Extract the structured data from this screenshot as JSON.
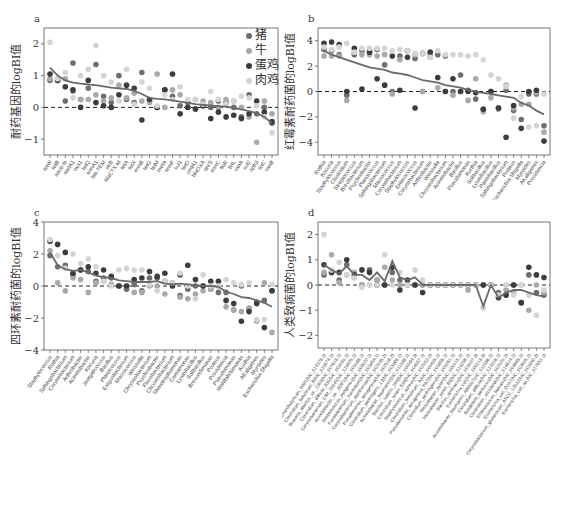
{
  "legend": {
    "items": [
      {
        "label": "猪",
        "color": "#6e6e6e"
      },
      {
        "label": "牛",
        "color": "#a9a9a9"
      },
      {
        "label": "蛋鸡",
        "color": "#3c3c3c"
      },
      {
        "label": "肉鸡",
        "color": "#d4d4d4"
      }
    ]
  },
  "colors": {
    "line": "#6a6a6a",
    "axis": "#555555",
    "zero": "#222222"
  },
  "chart_data": [
    {
      "id": "a",
      "type": "scatter",
      "panel_label": "a",
      "title": "",
      "xlabel": "",
      "ylabel": "耐药基因的logBI值",
      "ylim": [
        -1.5,
        2.5
      ],
      "yticks": [
        -1,
        0,
        1,
        2
      ],
      "legend_position": "top-right",
      "categories": [
        "tetW",
        "tetB",
        "aac6-Ib",
        "aadA1",
        "oxa1",
        "tetQ",
        "ermA1",
        "bla-TEM",
        "strB",
        "blaCTX-M",
        "tetA",
        "tetX",
        "ermB",
        "tetG",
        "tetM",
        "mefA",
        "ermF",
        "sul1",
        "tetO",
        "cmlA1",
        "blaOXA",
        "qnrS",
        "ermC",
        "floR",
        "tetL",
        "vanA",
        "sul2",
        "aph3",
        "tetC",
        "vanB"
      ],
      "series": [
        {
          "name": "猪",
          "values": [
            0.85,
            0.85,
            0.2,
            1.4,
            0.25,
            0.6,
            1.35,
            0.35,
            0.15,
            1.0,
            0.25,
            0.15,
            1.1,
            0.2,
            0.0,
            0.55,
            0.35,
            0.05,
            0.15,
            -0.05,
            0.05,
            0.0,
            0.2,
            0.15,
            0.0,
            -0.3,
            0.4,
            -0.2,
            0.0,
            -0.5
          ]
        },
        {
          "name": "牛",
          "values": [
            0.9,
            0.9,
            0.9,
            0.5,
            0.25,
            0.25,
            0.4,
            0.2,
            0.3,
            0.7,
            0.3,
            0.45,
            0.2,
            0.15,
            1.05,
            0.0,
            0.55,
            0.4,
            0.0,
            0.25,
            0.2,
            0.15,
            0.0,
            0.25,
            0.2,
            0.0,
            -0.3,
            -1.1,
            0.2,
            -0.2
          ]
        },
        {
          "name": "蛋鸡",
          "values": [
            1.05,
            0.85,
            0.65,
            0.55,
            0.0,
            0.85,
            0.15,
            0.05,
            0.0,
            0.4,
            0.7,
            0.6,
            -0.4,
            0.25,
            0.0,
            0.55,
            1.05,
            -0.2,
            0.0,
            -0.05,
            0.05,
            -0.35,
            -0.15,
            -0.3,
            -0.25,
            -0.35,
            -0.2,
            0.2,
            -0.15,
            -0.45
          ]
        },
        {
          "name": "肉鸡",
          "values": [
            2.05,
            0.9,
            1.1,
            0.3,
            1.0,
            1.2,
            1.95,
            1.0,
            0.8,
            0.2,
            1.2,
            0.1,
            0.8,
            0.6,
            0.05,
            0.4,
            0.25,
            0.65,
            0.25,
            0.25,
            0.1,
            0.5,
            0.25,
            0.1,
            0.2,
            0.35,
            0.3,
            0.05,
            -0.3,
            -0.8
          ]
        },
        {
          "name": "trend",
          "values": [
            1.25,
            1.0,
            0.85,
            0.78,
            0.75,
            0.72,
            0.7,
            0.66,
            0.62,
            0.6,
            0.58,
            0.52,
            0.42,
            0.3,
            0.27,
            0.25,
            0.22,
            0.18,
            0.14,
            0.1,
            0.08,
            0.06,
            0.04,
            0.02,
            -0.02,
            -0.06,
            -0.12,
            -0.18,
            -0.3,
            -0.5
          ]
        }
      ]
    },
    {
      "id": "b",
      "type": "scatter",
      "panel_label": "b",
      "xlabel": "",
      "ylabel": "红霉素耐药菌的logBI值",
      "ylim": [
        -5,
        5
      ],
      "yticks": [
        -4,
        -2,
        0,
        2,
        4
      ],
      "categories": [
        "Rothia",
        "Kocuria",
        "Staphylococcus",
        "Clostridium",
        "Streptococcus",
        "Brevibacterium",
        "Psychrobacter",
        "Planococcus",
        "Sphingobacterium",
        "Macrococcus",
        "Corynebacterium",
        "Staphylococcus",
        "Enterococcus",
        "Corynebacterium",
        "Arthrobacter",
        "Weissella",
        "Chryseobacterium",
        "Acinetobacter",
        "Bacillus",
        "Pseudomonas",
        "Kurthia",
        "Solibacillus",
        "Lysinibacillus",
        "Paenibacillus",
        "Sphingobacterium",
        "Proteus",
        "Escherichia-Shigella",
        "Myroides",
        "Alcaligenes",
        "Providencia"
      ],
      "series": [
        {
          "name": "猪",
          "values": [
            3.3,
            3.2,
            2.9,
            -0.3,
            2.9,
            3.2,
            3.2,
            3.3,
            2.1,
            0.0,
            2.8,
            3.2,
            2.6,
            0.0,
            2.7,
            2.9,
            2.8,
            0.0,
            1.3,
            0.1,
            -0.6,
            -1.4,
            0.0,
            -1.3,
            0.1,
            -1.5,
            -2.2,
            -0.2,
            -0.2,
            -2.7
          ]
        },
        {
          "name": "牛",
          "values": [
            2.8,
            2.8,
            2.8,
            -0.7,
            3.1,
            2.9,
            2.9,
            2.8,
            2.9,
            -0.2,
            2.5,
            3.2,
            2.9,
            0.0,
            2.9,
            0.3,
            0.0,
            -0.3,
            0.0,
            -0.7,
            1.0,
            -1.6,
            -0.5,
            -1.4,
            0.5,
            -1.3,
            -1.0,
            -1.0,
            -0.1,
            -3.2
          ]
        },
        {
          "name": "蛋鸡",
          "values": [
            3.8,
            3.9,
            3.7,
            0.0,
            3.4,
            0.2,
            3.1,
            1.0,
            0.5,
            2.8,
            0.1,
            2.7,
            -1.3,
            3.0,
            3.1,
            1.1,
            0.0,
            1.0,
            0.0,
            0.0,
            -0.1,
            -1.4,
            0.0,
            -1.3,
            -3.6,
            -1.1,
            -2.9,
            0.0,
            0.1,
            -3.9
          ]
        },
        {
          "name": "肉鸡",
          "values": [
            3.5,
            3.3,
            3.5,
            3.8,
            3.1,
            3.4,
            3.4,
            3.4,
            3.4,
            3.2,
            3.3,
            3.2,
            3.0,
            3.0,
            2.7,
            3.2,
            2.9,
            2.9,
            2.9,
            2.8,
            2.9,
            2.5,
            1.3,
            1.0,
            0.4,
            -2.1,
            -0.4,
            -2.8,
            -2.7,
            -0.2
          ]
        },
        {
          "name": "trend",
          "values": [
            3.2,
            2.9,
            2.7,
            2.5,
            2.3,
            2.1,
            1.9,
            1.8,
            1.7,
            1.5,
            1.4,
            1.3,
            1.1,
            0.9,
            0.8,
            0.7,
            0.5,
            0.4,
            0.3,
            0.1,
            0.0,
            -0.1,
            -0.2,
            -0.3,
            -0.4,
            -0.5,
            -0.9,
            -1.1,
            -1.5,
            -1.8
          ]
        }
      ]
    },
    {
      "id": "c",
      "type": "scatter",
      "panel_label": "c",
      "xlabel": "",
      "ylabel": "四环素耐药菌的logBI值",
      "ylim": [
        -4,
        4
      ],
      "yticks": [
        -4,
        -2,
        0,
        2,
        4
      ],
      "categories": [
        "Staphylococcus",
        "Rothia",
        "Sphingobacterium",
        "Corynebacterium",
        "Arthrobacter",
        "Acinetobacter",
        "Kocuria",
        "Jeotgalicoccus",
        "Bacillus",
        "Planococcus",
        "Exiguobacterium",
        "Macrococcus",
        "Weissella",
        "Chryseobacterium",
        "Psychrobacter",
        "Flavobacterium",
        "Chryseobacterium",
        "Stenotrophomonas",
        "Comamonas",
        "Lysinibacillus",
        "Solibacillus",
        "Brevundimonas",
        "Proteus",
        "Providencia",
        "Pseudomonas",
        "Wohlfahrtiimonas",
        "Kurthia",
        "Alcaligenes",
        "Myroides",
        "Escherichia-Shigella"
      ],
      "series": [
        {
          "name": "猪",
          "values": [
            1.9,
            1.2,
            1.3,
            0.7,
            1.0,
            0.9,
            0.3,
            0.5,
            0.5,
            0.0,
            -0.2,
            0.1,
            -0.3,
            0.5,
            0.5,
            0.3,
            0.2,
            -0.6,
            -0.2,
            0.0,
            0.0,
            -0.2,
            -0.4,
            -0.4,
            -1.5,
            0.0,
            -1.4,
            -1.0,
            -0.9,
            -0.3
          ]
        },
        {
          "name": "牛",
          "values": [
            2.2,
            0.2,
            -0.3,
            0.5,
            0.4,
            -0.4,
            0.2,
            0.3,
            0.1,
            0.0,
            0.0,
            -0.4,
            -0.4,
            0.0,
            0.0,
            -0.5,
            0.0,
            -0.7,
            -0.8,
            -0.5,
            -0.3,
            -0.2,
            0.0,
            -1.3,
            -1.5,
            -1.6,
            -1.4,
            -2.2,
            0.2,
            -2.9
          ]
        },
        {
          "name": "蛋鸡",
          "values": [
            2.8,
            2.6,
            2.1,
            0.8,
            1.0,
            1.2,
            0.8,
            1.0,
            0.6,
            0.0,
            0.0,
            0.4,
            0.5,
            0.9,
            0.6,
            0.8,
            0.0,
            0.7,
            1.3,
            0.4,
            0.0,
            0.3,
            0.3,
            -0.9,
            -1.1,
            -2.2,
            -1.6,
            -1.1,
            -2.6,
            -0.3
          ]
        },
        {
          "name": "肉鸡",
          "values": [
            2.9,
            1.9,
            1.1,
            2.0,
            1.4,
            1.7,
            1.2,
            0.3,
            0.0,
            1.0,
            1.1,
            1.0,
            1.0,
            0.1,
            -0.3,
            0.3,
            0.2,
            0.8,
            0.0,
            -0.8,
            0.7,
            0.0,
            0.0,
            0.4,
            0.2,
            0.1,
            0.2,
            -2.1,
            -2.1,
            0.1
          ]
        },
        {
          "name": "trend",
          "values": [
            2.1,
            1.3,
            1.05,
            0.95,
            1.0,
            0.85,
            0.65,
            0.55,
            0.5,
            0.35,
            0.3,
            0.25,
            0.25,
            0.25,
            0.3,
            0.15,
            0.1,
            0.15,
            0.1,
            0.05,
            0.0,
            0.0,
            -0.05,
            -0.35,
            -0.5,
            -0.7,
            -0.75,
            -0.9,
            -1.05,
            -1.3
          ]
        }
      ]
    },
    {
      "id": "d",
      "type": "scatter",
      "panel_label": "d",
      "xlabel": "",
      "ylabel": "人类致病菌的logBI值",
      "ylim": [
        -2.5,
        2.5
      ],
      "yticks": [
        -2,
        -1,
        0,
        1,
        2
      ],
      "categories": [
        "Clostridium_saccharobutylicum_WM1(NC_014378.1)",
        "Clostridium_botulinum_B(NC_010674.1)",
        "Brucella_abortus_str._2308(NC_007618.1)",
        "Clostridium_difficile_630(NC_009089.1)",
        "Corynebacterium_CIM_20045(NC_018425.1)",
        "Acinetobacter_sp._ADP1(NC_005966.1)",
        "Streptococcus_pyogenes(NC_008022.1)",
        "Fusobacterium_nucleatum(NC_003454.1)",
        "Corynebacterium_diphtheriae(NC_002935.2)",
        "Pseudomonas_aeruginosa(NC_002516.2)",
        "Clostridium_perfringens_13(NC_003366.1)",
        "Acinetobacter_baumannii(NC_011586.1)",
        "Bacillus_subtilis_168(NC_000964.3)",
        "Clostridium_tetani_E88(NC_004557.1)",
        "Staphylococcus_aureus(NC_002952.2)",
        "Clostridium_botulinum_A(NC_009495.1)",
        "Pseudomonas_aeruginosa_PA7(NC_009656.1)",
        "Clostridium_perfringens(NC_008261.1)",
        "Helicobacter_pylori(NC_000915.1)",
        "Helicobacter_pylori_B8(NC_014256.1)",
        "Bacillus_anthracis(NC_003997.3)",
        "Escherichia_coli(NC_000913.3)",
        "Acinetobacter_baumannii_AB0057(NC_011586.1)",
        "Clostridium_difficile(NC_013316.1)",
        "Bordetella_pertussis(NC_002929.2)",
        "Clostridium_sticklandii(NC_014614.1)",
        "Enterococcus_faecalis(NC_004668.1)",
        "Escherichia_coli_O157(NC_002695.1)",
        "Corynebacterium_glutamicum_ATCC_13032(NC_003450.3)",
        "Escherichia_coli_sp.(NC_017651.1)"
      ],
      "series": [
        {
          "name": "猪",
          "values": [
            0.4,
            0.5,
            0.2,
            0.8,
            0.3,
            0.0,
            0.6,
            0.2,
            0.0,
            0.5,
            0.2,
            0.0,
            0.0,
            0.0,
            0.0,
            0.0,
            0.0,
            0.0,
            0.0,
            0.0,
            0.0,
            0.0,
            0.0,
            -0.3,
            -0.4,
            0.0,
            -0.7,
            0.4,
            -0.3,
            -0.4
          ]
        },
        {
          "name": "牛",
          "values": [
            0.5,
            1.2,
            0.1,
            0.4,
            0.5,
            0.0,
            0.0,
            0.2,
            0.7,
            0.2,
            0.0,
            0.0,
            0.0,
            0.0,
            0.0,
            0.0,
            0.0,
            0.0,
            0.0,
            -0.2,
            0.0,
            -0.9,
            0.0,
            -0.5,
            -0.2,
            -0.3,
            0.0,
            -1.0,
            0.0,
            -0.3
          ]
        },
        {
          "name": "蛋鸡",
          "values": [
            0.8,
            0.5,
            0.5,
            1.0,
            0.4,
            0.6,
            0.5,
            0.0,
            0.0,
            0.7,
            -0.2,
            0.2,
            0.0,
            -0.3,
            0.0,
            0.0,
            0.0,
            0.0,
            0.0,
            0.0,
            0.0,
            0.0,
            0.0,
            -0.5,
            -0.4,
            0.0,
            -0.7,
            0.7,
            0.4,
            0.3
          ]
        },
        {
          "name": "肉鸡",
          "values": [
            2.0,
            0.6,
            0.9,
            0.4,
            0.3,
            -0.1,
            0.0,
            0.0,
            1.2,
            0.0,
            0.5,
            0.0,
            0.6,
            0.2,
            0.0,
            0.0,
            0.0,
            0.0,
            0.0,
            0.0,
            0.0,
            -0.9,
            0.0,
            -0.4,
            0.0,
            -0.4,
            0.0,
            -0.4,
            -1.2,
            -0.2
          ]
        },
        {
          "name": "trend",
          "values": [
            0.8,
            0.6,
            0.45,
            0.75,
            0.4,
            0.4,
            0.2,
            0.5,
            0.15,
            0.95,
            0.3,
            0.2,
            0.3,
            0.0,
            0.0,
            0.0,
            0.0,
            0.0,
            0.0,
            0.0,
            0.0,
            -0.85,
            0.0,
            -0.5,
            -0.3,
            -0.2,
            -0.2,
            -0.3,
            -0.4,
            -0.45
          ]
        }
      ]
    }
  ]
}
